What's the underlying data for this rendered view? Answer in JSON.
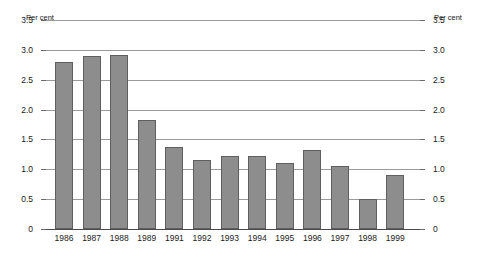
{
  "chart_data": {
    "type": "bar",
    "title": "",
    "xlabel": "",
    "ylabel": "Per cent",
    "ylabel_right": "Per cent",
    "ylim": [
      0,
      3.5
    ],
    "ytick_step": 0.5,
    "grid": true,
    "legend": "none",
    "bar_color": "#8d8d8d",
    "bar_border_color": "#5f5f5f",
    "categories": [
      "1986",
      "1987",
      "1988",
      "1989",
      "1991",
      "1992",
      "1993",
      "1994",
      "1995",
      "1996",
      "1997",
      "1998",
      "1999"
    ],
    "values": [
      2.8,
      2.9,
      2.92,
      1.82,
      1.38,
      1.16,
      1.22,
      1.22,
      1.1,
      1.32,
      1.06,
      0.5,
      0.9
    ],
    "ytick_labels": [
      "3.5",
      "3.0",
      "2.5",
      "2.0",
      "1.5",
      "1.0",
      "0.5",
      "0"
    ],
    "ytick_values": [
      3.5,
      3.0,
      2.5,
      2.0,
      1.5,
      1.0,
      0.5,
      0
    ]
  }
}
